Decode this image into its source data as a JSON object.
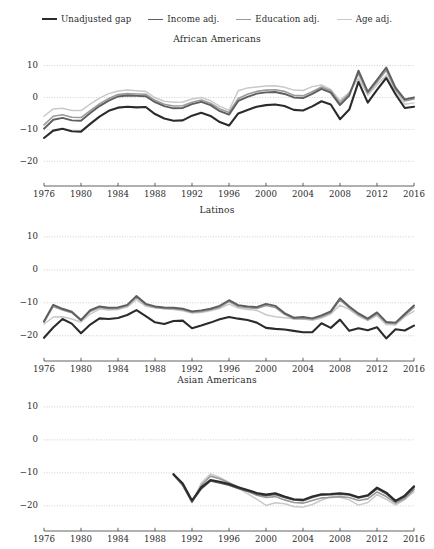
{
  "figure": {
    "clipped_caption": "",
    "series_order": [
      "Unadjusted gap",
      "Income adj.",
      "Education adj.",
      "Age adj."
    ],
    "series_colors": [
      "#2b2b2b",
      "#5e5e5e",
      "#9a9a9a",
      "#c9c9c9"
    ]
  },
  "legend": {
    "position": "top-center",
    "items": [
      {
        "label": "Unadjusted gap",
        "color": "#2b2b2b",
        "width": 2.1
      },
      {
        "label": "Income adj.",
        "color": "#5e5e5e",
        "width": 1.9
      },
      {
        "label": "Education adj.",
        "color": "#9a9a9a",
        "width": 1.6
      },
      {
        "label": "Age adj.",
        "color": "#c9c9c9",
        "width": 1.5
      }
    ]
  },
  "axes": {
    "y_ticks": [
      "10",
      "0",
      "-10",
      "-20"
    ],
    "y_tick_values": [
      10,
      0,
      -10,
      -20
    ],
    "ylim": [
      -24,
      13
    ],
    "x_ticks": [
      "1976",
      "1980",
      "1984",
      "1988",
      "1992",
      "1996",
      "2000",
      "2004",
      "2008",
      "2012",
      "2016"
    ],
    "x_tick_values": [
      1976,
      1980,
      1984,
      1988,
      1992,
      1996,
      2000,
      2004,
      2008,
      2012,
      2016
    ],
    "xlim": [
      1976,
      2016
    ],
    "grid": "dotted-horizontal",
    "ylabel": "",
    "xlabel": ""
  },
  "panels": [
    {
      "title": "African Americans"
    },
    {
      "title": "Latinos"
    },
    {
      "title": "Asian Americans"
    }
  ],
  "chart_data": [
    {
      "type": "line",
      "title": "African Americans",
      "xlabel": "",
      "ylabel": "",
      "ylim": [
        -24,
        13
      ],
      "xlim": [
        1976,
        2016
      ],
      "grid": true,
      "legend_position": "top-center",
      "x": [
        1976,
        1977,
        1978,
        1979,
        1980,
        1981,
        1982,
        1983,
        1984,
        1985,
        1986,
        1987,
        1988,
        1989,
        1990,
        1991,
        1992,
        1993,
        1994,
        1995,
        1996,
        1997,
        1998,
        1999,
        2000,
        2001,
        2002,
        2003,
        2004,
        2005,
        2006,
        2007,
        2008,
        2009,
        2010,
        2011,
        2012,
        2013,
        2014,
        2015,
        2016
      ],
      "series": [
        {
          "name": "Unadjusted gap",
          "values": [
            -12.7,
            -10.4,
            -9.8,
            -10.6,
            -10.7,
            -8.3,
            -6.0,
            -4.2,
            -3.2,
            -2.9,
            -3.1,
            -3.0,
            -5.2,
            -6.6,
            -7.3,
            -7.2,
            -5.7,
            -4.8,
            -5.8,
            -7.7,
            -8.8,
            -5.0,
            -3.9,
            -2.9,
            -2.4,
            -2.2,
            -2.7,
            -3.9,
            -4.1,
            -2.8,
            -1.2,
            -2.2,
            -6.8,
            -3.8,
            4.9,
            -1.6,
            2.4,
            6.1,
            1.0,
            -3.3,
            -2.9
          ]
        },
        {
          "name": "Income adj.",
          "values": [
            -9.8,
            -7.0,
            -6.4,
            -7.2,
            -7.3,
            -4.9,
            -2.7,
            -1.0,
            0.3,
            0.6,
            0.5,
            0.4,
            -1.5,
            -2.7,
            -3.4,
            -3.3,
            -2.1,
            -1.4,
            -2.4,
            -4.3,
            -5.4,
            -1.1,
            0.2,
            1.2,
            1.6,
            1.7,
            1.1,
            0.0,
            -0.2,
            1.1,
            2.7,
            1.5,
            -2.4,
            0.6,
            8.4,
            1.8,
            5.5,
            9.4,
            3.1,
            -0.6,
            0.0
          ]
        },
        {
          "name": "Education adj.",
          "values": [
            -8.6,
            -5.9,
            -5.4,
            -6.2,
            -6.3,
            -4.1,
            -2.0,
            -0.3,
            0.9,
            1.2,
            1.1,
            1.0,
            -0.9,
            -2.1,
            -2.7,
            -2.6,
            -1.5,
            -0.8,
            -1.8,
            -3.6,
            -4.7,
            -0.3,
            1.0,
            1.9,
            2.3,
            2.4,
            1.9,
            0.7,
            0.5,
            1.8,
            3.3,
            2.1,
            -1.7,
            1.2,
            7.5,
            1.3,
            4.8,
            8.5,
            2.4,
            -1.1,
            -0.5
          ]
        },
        {
          "name": "Age adj.",
          "values": [
            -5.9,
            -3.6,
            -3.4,
            -4.1,
            -4.1,
            -2.1,
            -0.2,
            1.2,
            2.0,
            2.3,
            2.1,
            1.9,
            -0.1,
            -1.2,
            -1.5,
            -1.4,
            -0.5,
            0.0,
            -1.0,
            -2.8,
            -4.0,
            2.1,
            3.0,
            3.3,
            3.6,
            3.7,
            3.2,
            2.3,
            2.2,
            3.4,
            3.9,
            2.5,
            -1.0,
            1.6,
            6.0,
            0.7,
            3.9,
            7.0,
            1.7,
            -2.1,
            -1.7
          ]
        }
      ]
    },
    {
      "type": "line",
      "title": "Latinos",
      "xlabel": "",
      "ylabel": "",
      "ylim": [
        -24,
        13
      ],
      "xlim": [
        1976,
        2016
      ],
      "grid": true,
      "legend_position": "top-center",
      "x": [
        1976,
        1977,
        1978,
        1979,
        1980,
        1981,
        1982,
        1983,
        1984,
        1985,
        1986,
        1987,
        1988,
        1989,
        1990,
        1991,
        1992,
        1993,
        1994,
        1995,
        1996,
        1997,
        1998,
        1999,
        2000,
        2001,
        2002,
        2003,
        2004,
        2005,
        2006,
        2007,
        2008,
        2009,
        2010,
        2011,
        2012,
        2013,
        2014,
        2015,
        2016
      ],
      "series": [
        {
          "name": "Unadjusted gap",
          "values": [
            -20.6,
            -17.5,
            -14.9,
            -16.3,
            -19.2,
            -16.6,
            -14.7,
            -14.9,
            -14.6,
            -13.7,
            -12.2,
            -14.0,
            -15.9,
            -16.4,
            -15.5,
            -15.4,
            -17.7,
            -16.9,
            -16.0,
            -15.0,
            -14.3,
            -14.8,
            -15.2,
            -16.0,
            -17.6,
            -17.9,
            -18.1,
            -18.5,
            -18.9,
            -18.9,
            -16.2,
            -17.6,
            -15.1,
            -18.5,
            -17.7,
            -18.3,
            -17.4,
            -20.8,
            -18.0,
            -18.4,
            -16.9
          ]
        },
        {
          "name": "Income adj.",
          "values": [
            -15.6,
            -10.6,
            -11.8,
            -12.7,
            -15.2,
            -12.2,
            -11.1,
            -11.5,
            -11.4,
            -10.6,
            -7.9,
            -10.3,
            -11.1,
            -11.4,
            -11.5,
            -11.8,
            -12.6,
            -12.3,
            -11.8,
            -10.9,
            -9.2,
            -10.7,
            -11.1,
            -11.3,
            -10.3,
            -10.9,
            -13.1,
            -14.5,
            -14.3,
            -14.7,
            -13.8,
            -12.6,
            -8.6,
            -11.1,
            -13.2,
            -14.8,
            -12.9,
            -15.8,
            -16.0,
            -13.4,
            -10.8
          ]
        },
        {
          "name": "Education adj.",
          "values": [
            -15.9,
            -11.1,
            -12.2,
            -13.0,
            -15.4,
            -12.6,
            -11.4,
            -11.8,
            -11.7,
            -10.9,
            -8.3,
            -10.6,
            -11.4,
            -11.7,
            -11.8,
            -12.1,
            -12.9,
            -12.6,
            -12.1,
            -11.3,
            -9.6,
            -11.1,
            -11.5,
            -11.7,
            -10.8,
            -11.4,
            -13.5,
            -14.8,
            -14.7,
            -15.0,
            -14.2,
            -13.0,
            -9.1,
            -11.5,
            -13.6,
            -15.1,
            -13.3,
            -16.1,
            -16.3,
            -13.8,
            -11.4
          ]
        },
        {
          "name": "Age adj.",
          "values": [
            -16.5,
            -14.3,
            -14.2,
            -14.9,
            -15.8,
            -13.4,
            -11.9,
            -12.2,
            -12.0,
            -11.3,
            -9.0,
            -11.0,
            -11.5,
            -11.8,
            -12.0,
            -12.4,
            -13.1,
            -12.9,
            -12.4,
            -11.7,
            -10.4,
            -11.6,
            -12.0,
            -12.3,
            -13.6,
            -14.2,
            -14.5,
            -14.8,
            -14.9,
            -15.3,
            -14.6,
            -13.4,
            -10.7,
            -12.0,
            -14.0,
            -15.4,
            -13.8,
            -16.6,
            -16.7,
            -14.2,
            -12.5
          ]
        }
      ]
    },
    {
      "type": "line",
      "title": "Asian Americans",
      "xlabel": "",
      "ylabel": "",
      "ylim": [
        -24,
        13
      ],
      "xlim": [
        1976,
        2016
      ],
      "grid": true,
      "legend_position": "top-center",
      "x": [
        1990,
        1991,
        1992,
        1993,
        1994,
        1995,
        1996,
        1997,
        1998,
        1999,
        2000,
        2001,
        2002,
        2003,
        2004,
        2005,
        2006,
        2007,
        2008,
        2009,
        2010,
        2011,
        2012,
        2013,
        2014,
        2015,
        2016
      ],
      "series": [
        {
          "name": "Unadjusted gap",
          "values": [
            -10.4,
            -13.2,
            -18.4,
            -14.4,
            -12.2,
            -12.7,
            -13.4,
            -14.4,
            -15.2,
            -16.1,
            -16.6,
            -16.2,
            -17.2,
            -18.0,
            -18.2,
            -17.2,
            -16.5,
            -16.4,
            -16.2,
            -16.5,
            -17.4,
            -16.8,
            -14.5,
            -16.0,
            -18.5,
            -16.9,
            -14.1
          ]
        },
        {
          "name": "Income adj.",
          "values": [
            -10.6,
            -13.6,
            -18.7,
            -14.8,
            -12.4,
            -13.0,
            -13.7,
            -14.7,
            -15.5,
            -16.4,
            -16.9,
            -16.5,
            -17.4,
            -18.2,
            -18.4,
            -17.4,
            -16.7,
            -16.6,
            -16.4,
            -16.7,
            -17.6,
            -17.0,
            -14.8,
            -16.3,
            -18.7,
            -17.2,
            -14.4
          ]
        },
        {
          "name": "Education adj.",
          "values": [
            -10.4,
            -13.8,
            -18.9,
            -13.8,
            -11.0,
            -11.8,
            -13.0,
            -14.3,
            -15.6,
            -16.8,
            -17.5,
            -17.2,
            -18.2,
            -19.0,
            -19.2,
            -18.4,
            -17.6,
            -17.5,
            -17.2,
            -17.5,
            -18.4,
            -17.9,
            -15.8,
            -17.2,
            -19.2,
            -17.8,
            -15.0
          ]
        },
        {
          "name": "Age adj.",
          "values": [
            -10.2,
            -13.9,
            -19.1,
            -13.1,
            -10.3,
            -11.4,
            -12.9,
            -14.6,
            -16.3,
            -18.0,
            -19.9,
            -19.1,
            -19.4,
            -20.2,
            -20.4,
            -19.6,
            -18.3,
            -17.1,
            -17.4,
            -18.2,
            -19.8,
            -19.0,
            -16.6,
            -18.0,
            -19.8,
            -18.1,
            -15.7
          ]
        }
      ]
    }
  ]
}
